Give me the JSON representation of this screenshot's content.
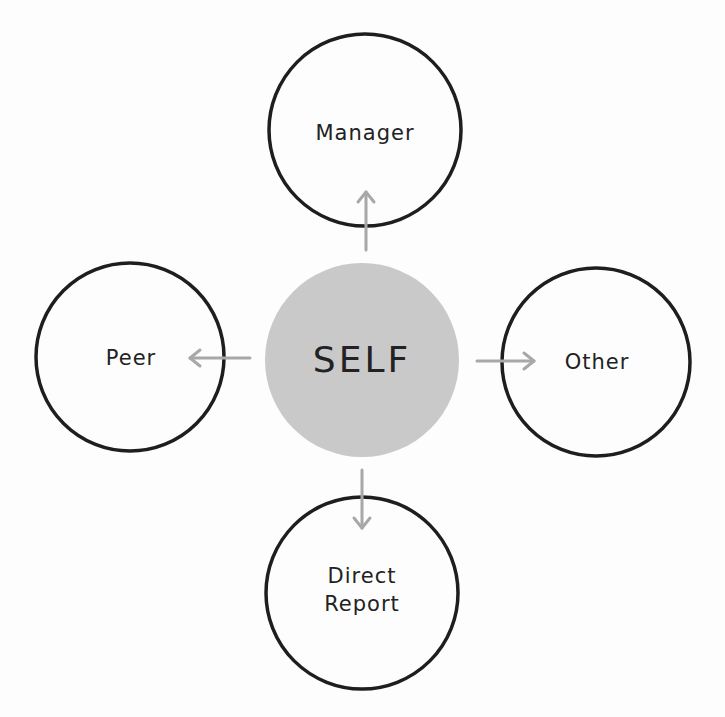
{
  "diagram": {
    "colors": {
      "outline": "#1e1e1e",
      "self_fill": "#c9c9c9",
      "arrow": "#a8a8a8",
      "text": "#222222"
    },
    "nodes": {
      "self": {
        "label": "SELF"
      },
      "manager": {
        "label": "Manager"
      },
      "peer": {
        "label": "Peer"
      },
      "other": {
        "label": "Other"
      },
      "direct_report": {
        "label": "Direct\nReport"
      }
    },
    "edges": [
      {
        "from": "SELF",
        "to": "Manager",
        "direction": "up"
      },
      {
        "from": "SELF",
        "to": "Peer",
        "direction": "left"
      },
      {
        "from": "SELF",
        "to": "Other",
        "direction": "right"
      },
      {
        "from": "SELF",
        "to": "Direct Report",
        "direction": "down"
      }
    ]
  }
}
